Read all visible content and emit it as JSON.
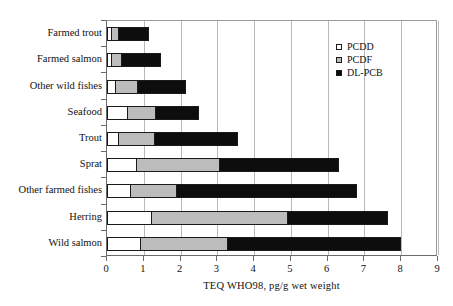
{
  "chart_data": {
    "type": "bar",
    "orientation": "horizontal",
    "stacked": true,
    "title": "",
    "xlabel": "TEQ WHO98, pg/g wet weight",
    "ylabel": "",
    "xlim": [
      0,
      9
    ],
    "xticks": [
      "0",
      "1",
      "2",
      "3",
      "4",
      "5",
      "6",
      "7",
      "8",
      "9"
    ],
    "grid": "vertical",
    "legend_position": "top-right",
    "categories": [
      "Farmed trout",
      "Farmed salmon",
      "Other wild fishes",
      "Seafood",
      "Trout",
      "Sprat",
      "Other farmed fishes",
      "Herring",
      "Wild salmon"
    ],
    "series": [
      {
        "name": "PCDD",
        "color": "#ffffff",
        "values": [
          0.1,
          0.1,
          0.22,
          0.55,
          0.3,
          0.8,
          0.63,
          1.2,
          0.9
        ]
      },
      {
        "name": "PCDF",
        "color": "#bcbcbc",
        "values": [
          0.2,
          0.27,
          0.6,
          0.75,
          0.98,
          2.25,
          1.25,
          3.7,
          2.35
        ]
      },
      {
        "name": "DL-PCB",
        "color": "#0d0d0d",
        "values": [
          0.85,
          1.11,
          1.33,
          1.2,
          2.27,
          3.25,
          4.92,
          2.75,
          4.75
        ]
      }
    ],
    "totals": [
      1.15,
      1.48,
      2.15,
      2.5,
      3.55,
      6.3,
      6.8,
      7.65,
      8.0
    ]
  },
  "legend": {
    "items": [
      {
        "label": "PCDD"
      },
      {
        "label": "PCDF"
      },
      {
        "label": "DL-PCB"
      }
    ]
  }
}
